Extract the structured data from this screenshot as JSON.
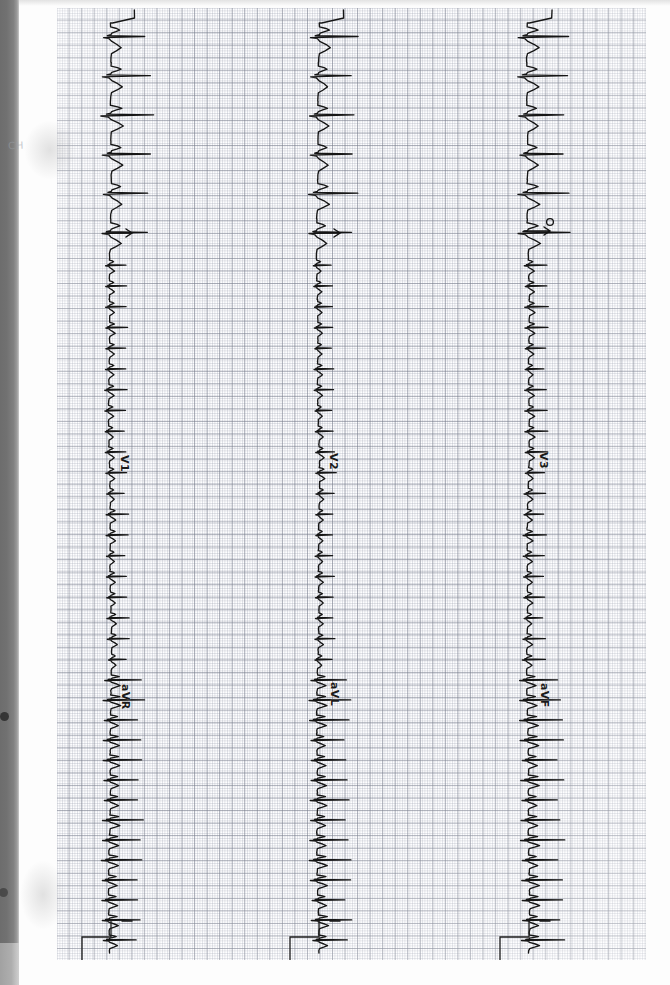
{
  "document": {
    "kind": "scanned-ecg-strip",
    "title": "ECG rhythm strip scan",
    "paper_color": "#fdfdfd",
    "grid_color_fine": "#969cac",
    "grid_color_bold": "#787d8c",
    "trace_color": "#161616",
    "scanner_edge_color": "#6d6d6d",
    "orientation_note": "strip mounted sideways; leads read top-to-bottom"
  },
  "channels": [
    {
      "id": "channel-left",
      "upper_lead_label": "V1",
      "lower_lead_label": "aVR",
      "baseline_x": 110,
      "annotation": "tick-marker"
    },
    {
      "id": "channel-middle",
      "upper_lead_label": "V2",
      "lower_lead_label": "aVL",
      "baseline_x": 318,
      "annotation": "tick-marker"
    },
    {
      "id": "channel-right",
      "upper_lead_label": "V3",
      "lower_lead_label": "aVF",
      "baseline_x": 528,
      "annotation": "circle-marker"
    }
  ],
  "margin_notes": [
    {
      "id": "pencil-note-left",
      "text": "CH"
    }
  ],
  "chart_data": {
    "type": "line",
    "xlabel": "",
    "ylabel": "",
    "grid": true,
    "legend_position": "inline-on-trace",
    "axis_note": "Time runs vertically down the page; amplitude deflects to the right of each baseline.",
    "series": [
      {
        "name": "V1 / aVR",
        "baseline_x_px": 110,
        "time_start_px": 10,
        "time_end_px": 958,
        "beats_visible": 42,
        "segments": [
          {
            "phase": "large-complex",
            "time_px": [
              10,
              245
            ],
            "beat_count": 6,
            "qrs_amplitude_px": 38
          },
          {
            "phase": "low-amplitude",
            "time_px": [
              245,
              660
            ],
            "beat_count": 20,
            "qrs_amplitude_px": 16
          },
          {
            "phase": "large-complex",
            "time_px": [
              660,
              940
            ],
            "beat_count": 14,
            "qrs_amplitude_px": 30
          },
          {
            "phase": "calibration-step",
            "time_px": [
              935,
              958
            ],
            "beat_count": 0,
            "qrs_amplitude_px": 28
          }
        ]
      },
      {
        "name": "V2 / aVL",
        "baseline_x_px": 318,
        "time_start_px": 10,
        "time_end_px": 958,
        "beats_visible": 42,
        "segments": [
          {
            "phase": "large-complex",
            "time_px": [
              10,
              245
            ],
            "beat_count": 6,
            "qrs_amplitude_px": 36
          },
          {
            "phase": "low-amplitude",
            "time_px": [
              245,
              660
            ],
            "beat_count": 20,
            "qrs_amplitude_px": 15
          },
          {
            "phase": "large-complex",
            "time_px": [
              660,
              940
            ],
            "beat_count": 14,
            "qrs_amplitude_px": 30
          },
          {
            "phase": "calibration-step",
            "time_px": [
              935,
              958
            ],
            "beat_count": 0,
            "qrs_amplitude_px": 28
          }
        ]
      },
      {
        "name": "V3 / aVF",
        "baseline_x_px": 528,
        "time_start_px": 10,
        "time_end_px": 958,
        "beats_visible": 42,
        "segments": [
          {
            "phase": "large-complex",
            "time_px": [
              10,
              245
            ],
            "beat_count": 6,
            "qrs_amplitude_px": 38
          },
          {
            "phase": "low-amplitude",
            "time_px": [
              245,
              660
            ],
            "beat_count": 20,
            "qrs_amplitude_px": 17
          },
          {
            "phase": "large-complex",
            "time_px": [
              660,
              940
            ],
            "beat_count": 14,
            "qrs_amplitude_px": 32
          },
          {
            "phase": "calibration-step",
            "time_px": [
              935,
              958
            ],
            "beat_count": 0,
            "qrs_amplitude_px": 28
          }
        ]
      }
    ]
  }
}
